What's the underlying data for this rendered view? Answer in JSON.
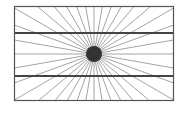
{
  "figure": {
    "title": "",
    "ray_count": 36,
    "colors": {
      "background": "#ffffff",
      "frame": "#555555",
      "horizontal_lines": "#444444",
      "rays": "#9a9a9a",
      "center_dot": "#333333"
    }
  }
}
